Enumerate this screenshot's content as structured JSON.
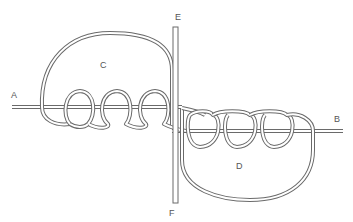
{
  "diagram": {
    "type": "knot-diagram",
    "labels": {
      "a": "A",
      "b": "B",
      "c": "C",
      "d": "D",
      "e": "E",
      "f": "F"
    },
    "colors": {
      "rope_outline": "#6a6a6a",
      "rope_fill": "#ffffff",
      "label": "#555555",
      "background": "#ffffff"
    },
    "elements": [
      {
        "name": "standing-end-a",
        "label": "A",
        "description": "left rope end entering horizontally"
      },
      {
        "name": "standing-end-b",
        "label": "B",
        "description": "right rope end exiting horizontally"
      },
      {
        "name": "bight-c",
        "label": "C",
        "description": "upper-left large loop with three coils"
      },
      {
        "name": "bight-d",
        "label": "D",
        "description": "lower-right large loop with three coils"
      },
      {
        "name": "bar-e-f",
        "labels": [
          "E",
          "F"
        ],
        "description": "vertical bar/rope passing through center"
      }
    ],
    "coil_counts": {
      "left": 3,
      "right": 3
    }
  }
}
